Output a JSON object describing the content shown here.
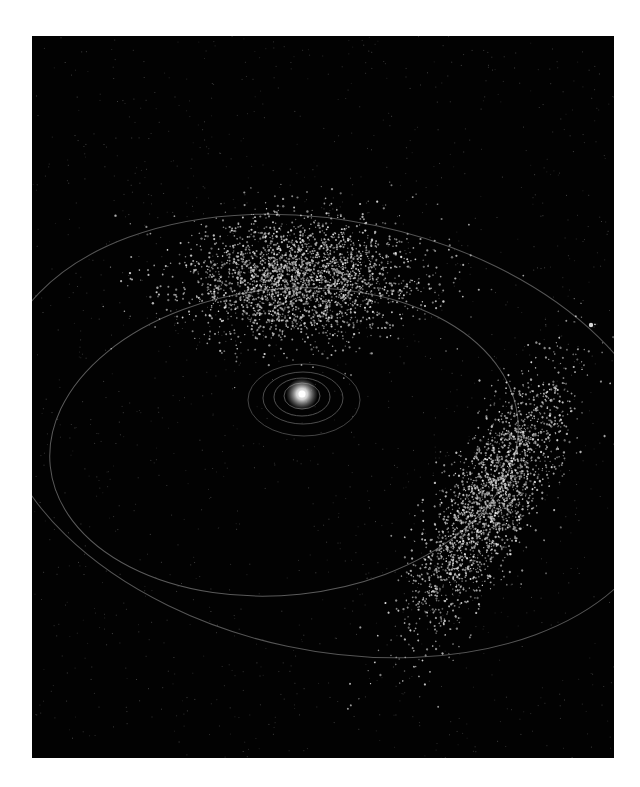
{
  "scene": {
    "subject": "Jupiter trojan asteroid swarms around the Sun",
    "background_color": "#020202",
    "page_color": "#ffffff",
    "frame": {
      "x": 32,
      "y": 36,
      "width": 582,
      "height": 722
    }
  },
  "sun": {
    "cx": 270,
    "cy": 358,
    "r_glow": 16,
    "color_core": "#ffffff",
    "color_glow": "#bfbfbf"
  },
  "planet_jupiter": {
    "cx": 559,
    "cy": 289,
    "r": 2.2,
    "color": "#d8d8d8"
  },
  "orbits": [
    {
      "name": "inner-orbit-1",
      "cx": 270,
      "cy": 360,
      "rx": 18,
      "ry": 13,
      "rotate": 0,
      "color": "#6a6a6a",
      "width": 0.8
    },
    {
      "name": "inner-orbit-2",
      "cx": 270,
      "cy": 361,
      "rx": 28,
      "ry": 19,
      "rotate": 0,
      "color": "#666666",
      "width": 0.8
    },
    {
      "name": "inner-orbit-3",
      "cx": 271,
      "cy": 362,
      "rx": 40,
      "ry": 26,
      "rotate": 0,
      "color": "#606060",
      "width": 0.8
    },
    {
      "name": "inner-orbit-4",
      "cx": 272,
      "cy": 364,
      "rx": 56,
      "ry": 36,
      "rotate": 0,
      "color": "#555555",
      "width": 0.8
    },
    {
      "name": "main-belt-orbit",
      "cx": 252,
      "cy": 406,
      "rx": 235,
      "ry": 153,
      "rotate": -6,
      "color": "#5a5a5a",
      "width": 1
    },
    {
      "name": "jupiter-orbit",
      "cx": 300,
      "cy": 400,
      "rx": 340,
      "ry": 215,
      "rotate": 12,
      "color": "#555555",
      "width": 1
    }
  ],
  "clusters": [
    {
      "name": "l4-trojan-swarm",
      "cx": 270,
      "cy": 243,
      "sx": 58,
      "sy": 30,
      "rotate": 0,
      "count": 2600,
      "color": "#d8d8d8"
    },
    {
      "name": "l5-trojan-swarm",
      "cx": 455,
      "cy": 468,
      "sx": 22,
      "sy": 72,
      "rotate": 28,
      "count": 2200,
      "color": "#d0d0d0"
    }
  ],
  "background_stars": {
    "count": 1400,
    "color": "#3a3a3a"
  }
}
